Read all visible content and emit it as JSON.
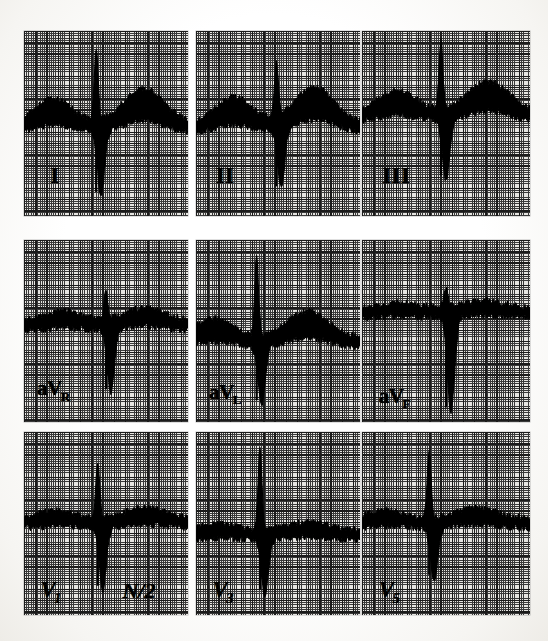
{
  "document": {
    "kind": "12-lead electrocardiogram (scanned figure)",
    "layout": "3 rows x 3 columns of lead panels",
    "background_color": "#fdfdfc",
    "paper_color": "#e6e5e1",
    "grid_bold_color": "#1b1b1b",
    "grid_fine_color": "#3a3a3a",
    "trace_color": "#000000"
  },
  "annotations": {
    "gain_note_label": "N/2",
    "gain_note_meaning": "half standardization"
  },
  "chart_data": {
    "type": "line",
    "title": "",
    "xlabel": "",
    "ylabel": "",
    "grid": true,
    "legend_position": "in-panel lead labels",
    "grid_spec": {
      "small_square_px": 2.24,
      "large_square_px": 11.2,
      "small_squares_per_large": 5
    },
    "panels": [
      {
        "lead": "I",
        "label": "I",
        "label_style": "roman",
        "row": 0,
        "col": 0,
        "x": 24,
        "y": 31,
        "width": 164,
        "height": 185,
        "baseline_pct": 52,
        "label_x_pct": 16,
        "label_y_pct": 72,
        "description": "Wide dark band of superimposed beats; tall narrow R spike with deep S; broad notched T-wave hump",
        "features": {
          "r_spike_x_pct": 44,
          "r_spike_top_pct": 14,
          "s_trough_pct": 87,
          "t_hump_x_pct": 73,
          "t_hump_top_pct": 34
        }
      },
      {
        "lead": "II",
        "label": "II",
        "label_style": "roman",
        "row": 0,
        "col": 1,
        "x": 196,
        "y": 31,
        "width": 164,
        "height": 185,
        "baseline_pct": 52,
        "label_x_pct": 12,
        "label_y_pct": 72,
        "description": "Dense band with two broad humps, sharp narrow R spike near centre and deep S descent",
        "features": {
          "r_spike_x_pct": 49,
          "r_spike_top_pct": 22,
          "s_trough_pct": 84,
          "t_hump_x_pct": 72,
          "t_hump_top_pct": 33
        }
      },
      {
        "lead": "III",
        "label": "III",
        "label_style": "roman",
        "row": 0,
        "col": 2,
        "x": 362,
        "y": 31,
        "width": 168,
        "height": 185,
        "baseline_pct": 46,
        "label_x_pct": 12,
        "label_y_pct": 72,
        "description": "Thick upper band of beats, narrow tall deflection column at centre, smaller second band to the right",
        "features": {
          "r_spike_x_pct": 47,
          "r_spike_top_pct": 10,
          "s_trough_pct": 78,
          "t_hump_x_pct": 75,
          "t_hump_top_pct": 30
        }
      },
      {
        "lead": "aVR",
        "label": "aV",
        "label_sub": "R",
        "label_style": "aug",
        "row": 1,
        "col": 0,
        "x": 24,
        "y": 240,
        "width": 164,
        "height": 182,
        "baseline_pct": 47,
        "label_x_pct": 8,
        "label_y_pct": 76,
        "description": "Broad dark band across full width; narrow downward spike at centre; two deep downward lobes either side",
        "features": {
          "r_spike_x_pct": 50,
          "r_spike_top_pct": 32,
          "s_trough_pct": 82,
          "t_hump_x_pct": 74,
          "t_hump_top_pct": 40
        }
      },
      {
        "lead": "aVL",
        "label": "aV",
        "label_sub": "L",
        "label_style": "aug",
        "row": 1,
        "col": 1,
        "x": 196,
        "y": 240,
        "width": 164,
        "height": 182,
        "baseline_pct": 56,
        "label_x_pct": 8,
        "label_y_pct": 78,
        "description": "Flat narrow baseline band; very tall thin R spike at centre followed by sharp deep S; broad raised T plateau to the right",
        "features": {
          "r_spike_x_pct": 37,
          "r_spike_top_pct": 13,
          "s_trough_pct": 88,
          "t_hump_x_pct": 68,
          "t_hump_top_pct": 42
        }
      },
      {
        "lead": "aVF",
        "label": "aV",
        "label_sub": "F",
        "label_style": "aug",
        "row": 1,
        "col": 2,
        "x": 362,
        "y": 240,
        "width": 168,
        "height": 182,
        "baseline_pct": 40,
        "label_x_pct": 10,
        "label_y_pct": 80,
        "description": "Two thick horizontal bands split by a narrow deep QS downstroke at centre",
        "features": {
          "r_spike_x_pct": 50,
          "r_spike_top_pct": 30,
          "s_trough_pct": 92,
          "t_hump_x_pct": 72,
          "t_hump_top_pct": 36
        }
      },
      {
        "lead": "V1",
        "label": "V",
        "label_sub": "1",
        "label_style": "prec",
        "row": 2,
        "col": 0,
        "x": 24,
        "y": 432,
        "width": 164,
        "height": 183,
        "baseline_pct": 50,
        "label_x_pct": 10,
        "label_y_pct": 80,
        "description": "Broad band with sharp upward R peak at centre and deep notched downward lobes on both sides; half-standard gain marked",
        "features": {
          "r_spike_x_pct": 45,
          "r_spike_top_pct": 20,
          "s_trough_pct": 84,
          "t_hump_x_pct": 74,
          "t_hump_top_pct": 44
        },
        "gain_note": "N/2",
        "gain_note_x_pct": 60,
        "gain_note_y_pct": 80
      },
      {
        "lead": "V3",
        "label": "V",
        "label_sub": "3",
        "label_style": "prec",
        "row": 2,
        "col": 1,
        "x": 196,
        "y": 432,
        "width": 164,
        "height": 183,
        "baseline_pct": 56,
        "label_x_pct": 10,
        "label_y_pct": 80,
        "description": "Flat thick baseline band; tall narrow R spike left of centre; deep wide S trough following, returning to band",
        "features": {
          "r_spike_x_pct": 39,
          "r_spike_top_pct": 12,
          "s_trough_pct": 86,
          "t_hump_x_pct": 68,
          "t_hump_top_pct": 52
        }
      },
      {
        "lead": "V5",
        "label": "V",
        "label_sub": "5",
        "label_style": "prec",
        "row": 2,
        "col": 2,
        "x": 362,
        "y": 432,
        "width": 168,
        "height": 183,
        "baseline_pct": 50,
        "label_x_pct": 10,
        "label_y_pct": 80,
        "description": "Thick baseline band; tall narrow R spike left of centre with deep S notch; band continues with slight elevation to the right",
        "features": {
          "r_spike_x_pct": 40,
          "r_spike_top_pct": 13,
          "s_trough_pct": 78,
          "t_hump_x_pct": 68,
          "t_hump_top_pct": 44
        }
      }
    ]
  }
}
